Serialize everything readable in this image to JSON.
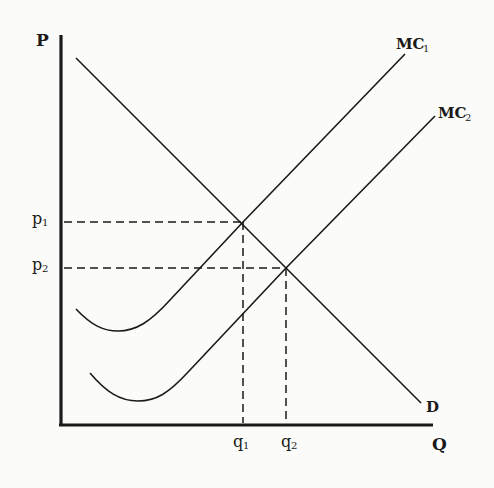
{
  "diagram": {
    "type": "economics-supply-demand",
    "axes": {
      "y_label": "P",
      "x_label": "Q"
    },
    "curves": {
      "demand": {
        "label": "D"
      },
      "mc1": {
        "label_main": "MC",
        "label_sub": "1"
      },
      "mc2": {
        "label_main": "MC",
        "label_sub": "2"
      }
    },
    "price_levels": [
      {
        "main": "p",
        "sub": "1"
      },
      {
        "main": "p",
        "sub": "2"
      }
    ],
    "quantity_levels": [
      {
        "main": "q",
        "sub": "1"
      },
      {
        "main": "q",
        "sub": "2"
      }
    ],
    "colors": {
      "ink": "#1a1a1a",
      "paper": "#fbfbf9"
    }
  }
}
